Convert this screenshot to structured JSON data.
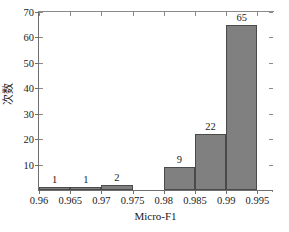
{
  "chart_data": {
    "type": "bar",
    "title": "",
    "xlabel": "Micro-F1",
    "ylabel": "次数",
    "bin_edges": [
      0.96,
      0.965,
      0.97,
      0.975,
      0.98,
      0.985,
      0.99,
      0.995
    ],
    "categories": [
      "0.96-0.965",
      "0.965-0.97",
      "0.97-0.975",
      "0.975-0.98",
      "0.98-0.985",
      "0.985-0.99",
      "0.99-0.995"
    ],
    "values": [
      1,
      1,
      2,
      0,
      9,
      22,
      65
    ],
    "bar_labels": [
      "1",
      "1",
      "2",
      "",
      "9",
      "22",
      "65"
    ],
    "xlim": [
      0.96,
      0.9975
    ],
    "ylim": [
      0,
      70
    ],
    "xticks": [
      0.96,
      0.965,
      0.97,
      0.975,
      0.98,
      0.985,
      0.99,
      0.995
    ],
    "xtick_labels": [
      "0.96",
      "0.965",
      "0.97",
      "0.975",
      "0.98",
      "0.985",
      "0.99",
      "0.995"
    ],
    "yticks": [
      10,
      20,
      30,
      40,
      50,
      60,
      70
    ],
    "ytick_labels": [
      "10",
      "20",
      "30",
      "40",
      "50",
      "60",
      "70"
    ],
    "grid": false,
    "legend": null,
    "bar_color": "#808080",
    "bar_edge_color": "#4a4a4a",
    "axis_color": "#6e6e6e",
    "background_color": "#ffffff"
  }
}
